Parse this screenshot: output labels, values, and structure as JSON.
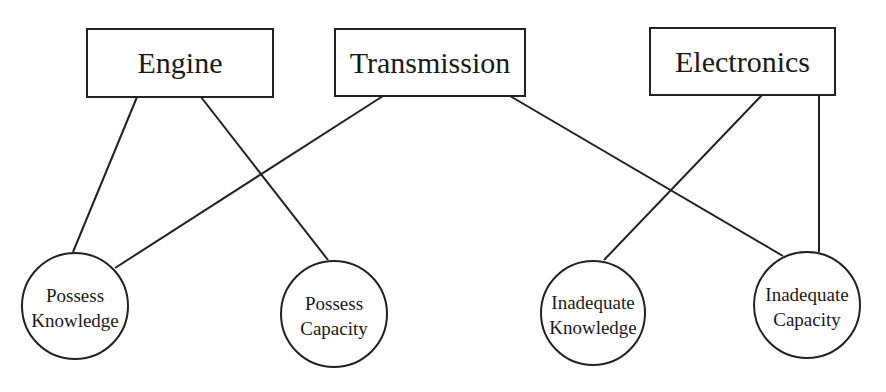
{
  "diagram": {
    "type": "bipartite-network",
    "stroke_color": "#222222",
    "background": "#ffffff",
    "boxes": [
      {
        "id": "engine",
        "label": "Engine",
        "x": 87,
        "y": 29,
        "w": 186,
        "h": 68
      },
      {
        "id": "transmission",
        "label": "Transmission",
        "x": 335,
        "y": 29,
        "w": 190,
        "h": 67
      },
      {
        "id": "electronics",
        "label": "Electronics",
        "x": 650,
        "y": 28,
        "w": 185,
        "h": 67
      }
    ],
    "circles": [
      {
        "id": "possess-knowledge",
        "line1": "Possess",
        "line2": "Knowledge",
        "cx": 75,
        "cy": 306,
        "r": 53
      },
      {
        "id": "possess-capacity",
        "line1": "Possess",
        "line2": "Capacity",
        "cx": 334,
        "cy": 314,
        "r": 53
      },
      {
        "id": "inadequate-knowledge",
        "line1": "Inadequate",
        "line2": "Knowledge",
        "cx": 593,
        "cy": 313,
        "r": 52
      },
      {
        "id": "inadequate-capacity",
        "line1": "Inadequate",
        "line2": "Capacity",
        "cx": 807,
        "cy": 305,
        "r": 53
      }
    ],
    "edges": [
      {
        "from": "engine",
        "to": "possess-knowledge",
        "x1": 137,
        "y1": 97,
        "x2": 73,
        "y2": 252
      },
      {
        "from": "engine",
        "to": "possess-capacity",
        "x1": 201,
        "y1": 97,
        "x2": 328,
        "y2": 260
      },
      {
        "from": "transmission",
        "to": "possess-knowledge",
        "x1": 383,
        "y1": 96,
        "x2": 115,
        "y2": 268
      },
      {
        "from": "transmission",
        "to": "inadequate-capacity",
        "x1": 510,
        "y1": 96,
        "x2": 783,
        "y2": 256
      },
      {
        "from": "electronics",
        "to": "inadequate-knowledge",
        "x1": 762,
        "y1": 95,
        "x2": 604,
        "y2": 260
      },
      {
        "from": "electronics",
        "to": "inadequate-capacity",
        "x1": 819,
        "y1": 95,
        "x2": 819,
        "y2": 252
      }
    ]
  }
}
